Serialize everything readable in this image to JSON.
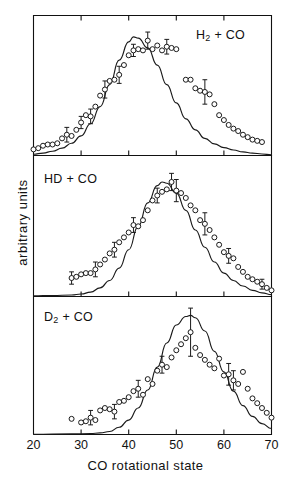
{
  "figure": {
    "xlabel": "CO rotational state",
    "ylabel": "arbitrary  units",
    "xticks": [
      "20",
      "30",
      "40",
      "50",
      "60",
      "70"
    ],
    "line_color": "#1a1a1a",
    "marker_color": "#1a1a1a",
    "axis_color": "#111111",
    "background": "#ffffff"
  },
  "chart_data": {
    "type": "scatter",
    "title": "",
    "xlabel": "CO rotational state",
    "ylabel": "arbitrary units",
    "xlim": [
      20,
      70
    ],
    "ylim": [
      0,
      1.08
    ],
    "grid": false,
    "legend": "none",
    "panels": [
      {
        "label": "H2 + CO",
        "label_display": "H₂ + CO",
        "curve": {
          "name": "calculated distribution",
          "x": [
            20,
            22,
            24,
            26,
            28,
            30,
            32,
            34,
            36,
            38,
            40,
            41,
            42,
            44,
            46,
            48,
            50,
            52,
            54,
            56,
            58,
            60,
            62,
            64,
            66,
            68,
            70
          ],
          "y": [
            0.01,
            0.02,
            0.035,
            0.06,
            0.1,
            0.16,
            0.26,
            0.4,
            0.58,
            0.78,
            0.93,
            0.97,
            0.96,
            0.88,
            0.74,
            0.58,
            0.43,
            0.3,
            0.21,
            0.14,
            0.095,
            0.065,
            0.045,
            0.03,
            0.02,
            0.012,
            0.006
          ]
        },
        "points": {
          "name": "experimental data",
          "x": [
            20,
            21,
            22,
            23,
            24,
            25,
            26,
            27,
            28,
            29,
            30,
            31,
            32,
            33,
            34,
            35,
            36,
            37,
            38,
            39,
            40,
            41,
            42,
            43,
            44,
            45,
            46,
            47,
            48,
            49,
            50,
            52,
            53,
            54,
            55,
            56,
            57,
            58,
            59,
            60,
            61,
            62,
            63,
            64,
            65,
            66,
            67,
            68
          ],
          "y": [
            0.05,
            0.06,
            0.08,
            0.09,
            0.09,
            0.1,
            0.14,
            0.17,
            0.16,
            0.21,
            0.27,
            0.33,
            0.32,
            0.4,
            0.49,
            0.54,
            0.61,
            0.62,
            0.66,
            0.74,
            0.82,
            0.86,
            0.87,
            0.86,
            0.94,
            0.87,
            0.9,
            0.86,
            0.89,
            0.88,
            0.87,
            0.62,
            0.62,
            0.55,
            0.53,
            0.52,
            0.5,
            0.42,
            0.33,
            0.29,
            0.25,
            0.22,
            0.2,
            0.17,
            0.15,
            0.13,
            0.12,
            0.11
          ]
        },
        "errorbars": [
          {
            "x": 27,
            "y": 0.17,
            "err": 0.06
          },
          {
            "x": 30,
            "y": 0.27,
            "err": 0.05
          },
          {
            "x": 32,
            "y": 0.32,
            "err": 0.06
          },
          {
            "x": 35,
            "y": 0.54,
            "err": 0.07
          },
          {
            "x": 38,
            "y": 0.66,
            "err": 0.07
          },
          {
            "x": 41,
            "y": 0.86,
            "err": 0.05
          },
          {
            "x": 44,
            "y": 0.94,
            "err": 0.07
          },
          {
            "x": 48,
            "y": 0.89,
            "err": 0.06
          },
          {
            "x": 56,
            "y": 0.52,
            "err": 0.1
          }
        ]
      },
      {
        "label": "HD + CO",
        "label_display": "HD + CO",
        "curve": {
          "name": "calculated distribution",
          "x": [
            20,
            24,
            28,
            30,
            32,
            34,
            36,
            38,
            40,
            42,
            44,
            46,
            47,
            48,
            50,
            52,
            54,
            56,
            58,
            60,
            62,
            64,
            66,
            68,
            70
          ],
          "y": [
            0.005,
            0.008,
            0.012,
            0.02,
            0.035,
            0.07,
            0.13,
            0.23,
            0.38,
            0.57,
            0.76,
            0.9,
            0.93,
            0.92,
            0.84,
            0.7,
            0.54,
            0.4,
            0.28,
            0.19,
            0.13,
            0.085,
            0.05,
            0.03,
            0.015
          ]
        },
        "points": {
          "name": "experimental data",
          "x": [
            28,
            29,
            30,
            31,
            32,
            33,
            34,
            35,
            36,
            37,
            38,
            39,
            40,
            41,
            42,
            43,
            44,
            45,
            46,
            47,
            48,
            49,
            50,
            51,
            52,
            53,
            54,
            55,
            56,
            57,
            58,
            59,
            60,
            61,
            62,
            63,
            64,
            65,
            66,
            67,
            68,
            69,
            70
          ],
          "y": [
            0.15,
            0.16,
            0.18,
            0.19,
            0.19,
            0.22,
            0.26,
            0.3,
            0.35,
            0.38,
            0.44,
            0.48,
            0.52,
            0.58,
            0.57,
            0.62,
            0.7,
            0.78,
            0.82,
            0.85,
            0.87,
            0.93,
            0.86,
            0.84,
            0.8,
            0.74,
            0.7,
            0.62,
            0.59,
            0.54,
            0.48,
            0.42,
            0.36,
            0.33,
            0.31,
            0.24,
            0.2,
            0.16,
            0.14,
            0.12,
            0.1,
            0.07,
            0.05
          ]
        },
        "errorbars": [
          {
            "x": 28,
            "y": 0.15,
            "err": 0.05
          },
          {
            "x": 33,
            "y": 0.22,
            "err": 0.06
          },
          {
            "x": 37,
            "y": 0.38,
            "err": 0.06
          },
          {
            "x": 41,
            "y": 0.58,
            "err": 0.06
          },
          {
            "x": 46,
            "y": 0.82,
            "err": 0.06
          },
          {
            "x": 49,
            "y": 0.93,
            "err": 0.07
          },
          {
            "x": 50,
            "y": 0.86,
            "err": 0.09
          },
          {
            "x": 56,
            "y": 0.59,
            "err": 0.09
          },
          {
            "x": 61,
            "y": 0.33,
            "err": 0.06
          },
          {
            "x": 68,
            "y": 0.1,
            "err": 0.04
          }
        ]
      },
      {
        "label": "D2 + CO",
        "label_display": "D₂ + CO",
        "curve": {
          "name": "calculated distribution",
          "x": [
            20,
            28,
            32,
            34,
            36,
            38,
            40,
            42,
            44,
            46,
            48,
            50,
            52,
            53,
            54,
            56,
            58,
            60,
            62,
            64,
            66,
            68,
            70
          ],
          "y": [
            0.002,
            0.005,
            0.008,
            0.013,
            0.025,
            0.06,
            0.12,
            0.22,
            0.37,
            0.56,
            0.76,
            0.91,
            0.98,
            0.99,
            0.97,
            0.86,
            0.69,
            0.52,
            0.36,
            0.24,
            0.15,
            0.09,
            0.05
          ]
        },
        "points": {
          "name": "experimental data",
          "x": [
            28,
            30,
            31,
            32,
            33,
            34,
            35,
            36,
            37,
            38,
            39,
            40,
            41,
            42,
            43,
            44,
            45,
            46,
            47,
            48,
            49,
            50,
            51,
            52,
            53,
            54,
            55,
            56,
            57,
            58,
            59,
            60,
            61,
            62,
            63,
            64,
            65,
            66,
            67,
            68,
            69,
            70
          ],
          "y": [
            0.13,
            0.1,
            0.11,
            0.14,
            0.12,
            0.2,
            0.22,
            0.21,
            0.19,
            0.27,
            0.28,
            0.31,
            0.36,
            0.38,
            0.33,
            0.46,
            0.42,
            0.53,
            0.58,
            0.56,
            0.64,
            0.7,
            0.75,
            0.8,
            0.85,
            0.72,
            0.66,
            0.62,
            0.58,
            0.55,
            0.63,
            0.49,
            0.5,
            0.45,
            0.42,
            0.52,
            0.38,
            0.3,
            0.26,
            0.22,
            0.18,
            0.14
          ]
        },
        "errorbars": [
          {
            "x": 32,
            "y": 0.14,
            "err": 0.06
          },
          {
            "x": 37,
            "y": 0.19,
            "err": 0.06
          },
          {
            "x": 42,
            "y": 0.38,
            "err": 0.07
          },
          {
            "x": 47,
            "y": 0.58,
            "err": 0.07
          },
          {
            "x": 53,
            "y": 0.85,
            "err": 0.2
          },
          {
            "x": 61,
            "y": 0.5,
            "err": 0.09
          },
          {
            "x": 62,
            "y": 0.45,
            "err": 0.08
          }
        ]
      }
    ]
  }
}
